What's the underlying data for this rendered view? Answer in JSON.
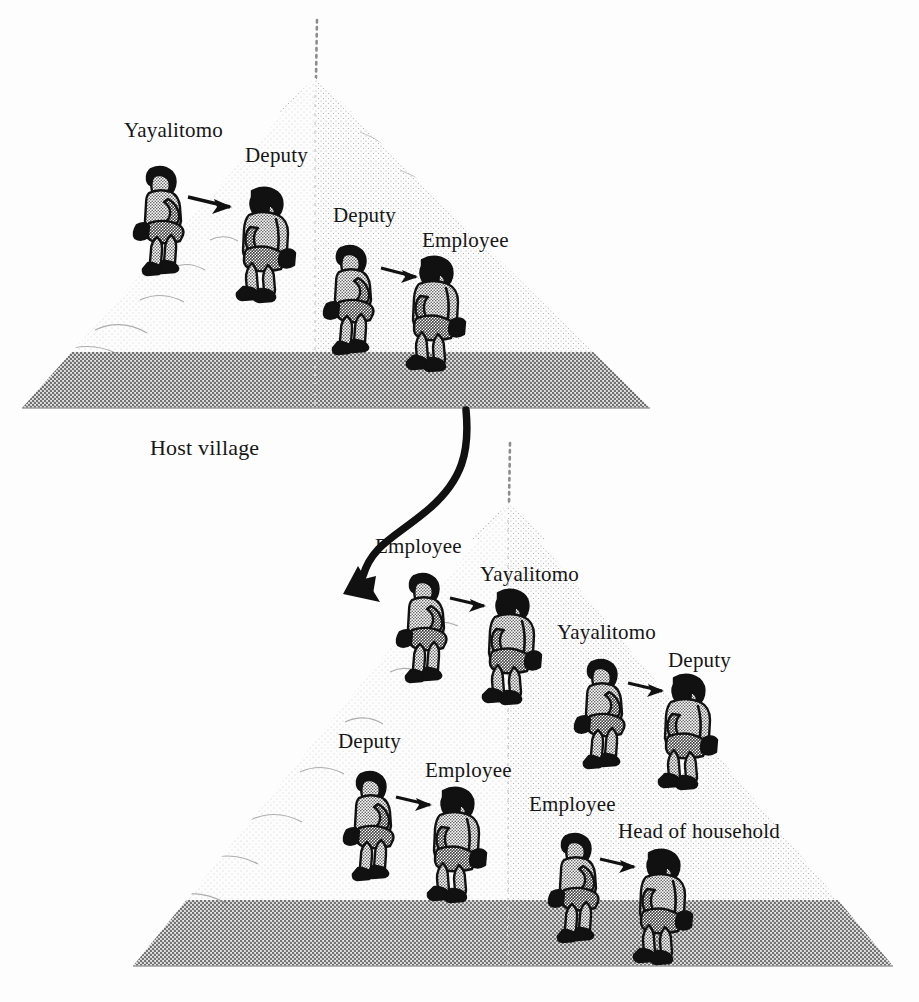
{
  "diagram": {
    "title_visible": false,
    "caption_host_village": "Host village",
    "background_color": "#fdfdfd",
    "ink_color": "#161616",
    "pyramid_fill_color": "#b9b9b9",
    "type": "two-tier village hierarchy pyramids with speech-chain pairs"
  },
  "pyramids": [
    {
      "id": "host-village",
      "label": "Host village",
      "label_position": {
        "x": 150,
        "y": 438
      },
      "apex": {
        "x": 315,
        "y": 78
      },
      "base_left": {
        "x": 22,
        "y": 408
      },
      "base_right": {
        "x": 650,
        "y": 408
      },
      "dotted_stem_top": {
        "x": 317,
        "y": 20
      },
      "pairs": [
        {
          "speaker": "Yayalitomo",
          "listener": "Deputy",
          "speaker_label_pos": {
            "x": 124,
            "y": 120
          },
          "listener_label_pos": {
            "x": 245,
            "y": 145
          },
          "speaker_fig": {
            "x": 135,
            "y": 163
          },
          "listener_fig": {
            "x": 238,
            "y": 183
          },
          "arrow": {
            "x1": 188,
            "y1": 197,
            "x2": 234,
            "y2": 208
          }
        },
        {
          "speaker": "Deputy",
          "listener": "Employee",
          "speaker_label_pos": {
            "x": 333,
            "y": 205
          },
          "listener_label_pos": {
            "x": 422,
            "y": 230
          },
          "speaker_fig": {
            "x": 325,
            "y": 242
          },
          "listener_fig": {
            "x": 408,
            "y": 252
          },
          "arrow": {
            "x1": 381,
            "y1": 268,
            "x2": 421,
            "y2": 279
          }
        }
      ]
    },
    {
      "id": "lower-village",
      "label": "",
      "apex": {
        "x": 508,
        "y": 503
      },
      "base_left": {
        "x": 133,
        "y": 966
      },
      "base_right": {
        "x": 893,
        "y": 966
      },
      "dotted_stem_top": {
        "x": 510,
        "y": 443
      },
      "pairs": [
        {
          "speaker": "Employee",
          "listener": "Yayalitomo",
          "speaker_label_pos": {
            "x": 375,
            "y": 536
          },
          "listener_label_pos": {
            "x": 480,
            "y": 564
          },
          "speaker_fig": {
            "x": 398,
            "y": 570
          },
          "listener_fig": {
            "x": 484,
            "y": 585
          },
          "arrow": {
            "x1": 448,
            "y1": 597,
            "x2": 485,
            "y2": 607
          }
        },
        {
          "speaker": "Yayalitomo",
          "listener": "Deputy",
          "speaker_label_pos": {
            "x": 557,
            "y": 622
          },
          "listener_label_pos": {
            "x": 668,
            "y": 650
          },
          "speaker_fig": {
            "x": 576,
            "y": 656
          },
          "listener_fig": {
            "x": 660,
            "y": 670
          },
          "arrow": {
            "x1": 626,
            "y1": 682,
            "x2": 663,
            "y2": 692
          }
        },
        {
          "speaker": "Deputy",
          "listener": "Employee",
          "speaker_label_pos": {
            "x": 338,
            "y": 731
          },
          "listener_label_pos": {
            "x": 425,
            "y": 760
          },
          "speaker_fig": {
            "x": 345,
            "y": 768
          },
          "listener_fig": {
            "x": 429,
            "y": 783
          },
          "arrow": {
            "x1": 394,
            "y1": 796,
            "x2": 431,
            "y2": 806
          }
        },
        {
          "speaker": "Employee",
          "listener": "Head of household",
          "speaker_label_pos": {
            "x": 529,
            "y": 794
          },
          "listener_label_pos": {
            "x": 618,
            "y": 821
          },
          "speaker_fig": {
            "x": 550,
            "y": 830
          },
          "listener_fig": {
            "x": 635,
            "y": 845
          },
          "arrow": {
            "x1": 598,
            "y1": 858,
            "x2": 636,
            "y2": 868
          }
        }
      ]
    }
  ],
  "connector_arrow": {
    "name": "host-to-lower-village-arrow",
    "from": {
      "x": 466,
      "y": 410
    },
    "to": {
      "x": 372,
      "y": 596
    },
    "style": "s-curve thick black with solid arrowhead"
  },
  "roles": [
    "Yayalitomo",
    "Deputy",
    "Employee",
    "Head of household"
  ],
  "labels_flat": [
    "Yayalitomo",
    "Deputy",
    "Deputy",
    "Employee",
    "Host village",
    "Employee",
    "Yayalitomo",
    "Yayalitomo",
    "Deputy",
    "Deputy",
    "Employee",
    "Employee",
    "Head of household"
  ]
}
